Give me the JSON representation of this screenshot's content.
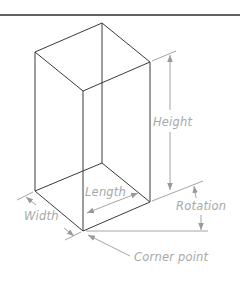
{
  "diagram": {
    "title": "",
    "type": "isometric box dimension diagram",
    "labels": {
      "height": "Height",
      "length": "Length",
      "width": "Width",
      "rotation": "Rotation",
      "corner_point": "Corner point"
    },
    "colors": {
      "edge": "#3a3a3a",
      "dimension": "#9a9a9a",
      "label": "#a8a8a8",
      "rule": "#2b2b2b",
      "background": "#ffffff"
    }
  }
}
